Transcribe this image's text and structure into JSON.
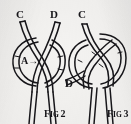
{
  "image": {
    "kind": "line-art-diagram",
    "subject": "knot tying instructional illustration",
    "background_color": "#f4f3f1",
    "ink_color": "#17161a"
  },
  "figures": [
    {
      "id": "fig-2",
      "caption_prefix": "F",
      "caption_small": "IG",
      "caption_number": "2",
      "labels": {
        "c": "C",
        "d": "D",
        "a": "A",
        "a_arrow": "→"
      }
    },
    {
      "id": "fig-3",
      "caption_prefix": "F",
      "caption_small": "IG",
      "caption_number": "3",
      "labels": {
        "c": "C",
        "d": "D"
      }
    }
  ]
}
